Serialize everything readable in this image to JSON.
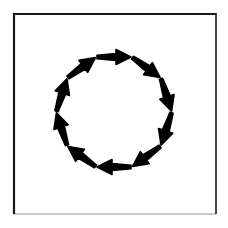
{
  "figure": {
    "background_color": "#ffffff",
    "canvas": {
      "width": 228,
      "height": 228
    }
  },
  "frame": {
    "name": "border-rectangle",
    "x": 13,
    "y": 13,
    "width": 203,
    "height": 201,
    "stroke_color": "#1a1a1a",
    "stroke_color_faded": "#c9c9c9",
    "stroke_width": 2
  },
  "guide_circle": {
    "name": "guide-circle",
    "center_x": 114,
    "center_y": 112,
    "radius": 55,
    "stroke_color": "#cfcfcf",
    "stroke_width": 1.1,
    "fill": "none"
  },
  "chart_data": {
    "type": "scatter",
    "xlabel": "",
    "ylabel": "",
    "legend_position": "none",
    "grid": false,
    "arrow_count": 10,
    "angular_step_degrees": 36,
    "rotation_direction": "clockwise",
    "arrow_color": "#000000",
    "arrow_length": 34,
    "arrow_head_width": 15,
    "arrow_head_length": 15,
    "arrow_shaft_width_base": 3.2,
    "arrow_shaft_width_tip": 7.0,
    "arrows": [
      {
        "index": 0,
        "position_angle_degrees": 270,
        "heading_degrees": 45,
        "center_x": 114,
        "center_y": 57,
        "label": "arrow-top"
      },
      {
        "index": 1,
        "position_angle_degrees": 306,
        "heading_degrees": 81,
        "center_x": 158,
        "center_y": 80,
        "label": "arrow-upper-right"
      },
      {
        "index": 2,
        "position_angle_degrees": 342,
        "heading_degrees": 117,
        "center_x": 166,
        "center_y": 129,
        "label": "arrow-right"
      },
      {
        "index": 3,
        "position_angle_degrees": 18,
        "heading_degrees": 153,
        "center_x": 146,
        "center_y": 169,
        "label": "arrow-lower-right"
      },
      {
        "index": 4,
        "position_angle_degrees": 54,
        "heading_degrees": 189,
        "center_x": 106,
        "center_y": 184,
        "label": "arrow-bottom-right"
      },
      {
        "index": 5,
        "position_angle_degrees": 90,
        "heading_degrees": 225,
        "center_x": 114,
        "center_y": 167,
        "label": "arrow-bottom"
      },
      {
        "index": 6,
        "position_angle_degrees": 126,
        "heading_degrees": 261,
        "center_x": 70,
        "center_y": 144,
        "label": "arrow-lower-left"
      },
      {
        "index": 7,
        "position_angle_degrees": 162,
        "heading_degrees": 297,
        "center_x": 62,
        "center_y": 95,
        "label": "arrow-left"
      },
      {
        "index": 8,
        "position_angle_degrees": 198,
        "heading_degrees": 333,
        "center_x": 82,
        "center_y": 55,
        "label": "arrow-upper-left"
      },
      {
        "index": 9,
        "position_angle_degrees": 234,
        "heading_degrees": 9,
        "center_x": 122,
        "center_y": 40,
        "label": "arrow-top-left"
      }
    ]
  }
}
